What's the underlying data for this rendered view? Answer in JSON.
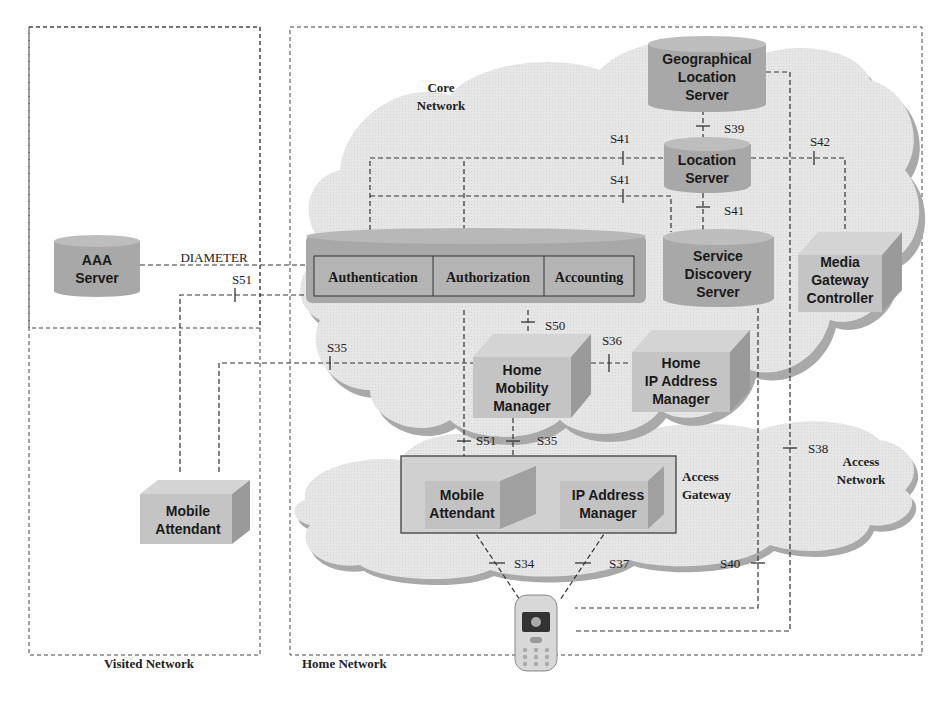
{
  "regions": {
    "visited": {
      "label": "Visited Network"
    },
    "home": {
      "label": "Home Network"
    },
    "core": {
      "label_line1": "Core",
      "label_line2": "Network"
    },
    "access": {
      "label_line1": "Access",
      "label_line2": "Network"
    },
    "access_gateway": {
      "label_line1": "Access",
      "label_line2": "Gateway"
    }
  },
  "nodes": {
    "aaa_server": {
      "line1": "AAA",
      "line2": "Server"
    },
    "geo_location_server": {
      "line1": "Geographical",
      "line2": "Location",
      "line3": "Server"
    },
    "location_server": {
      "line1": "Location",
      "line2": "Server"
    },
    "service_discovery_server": {
      "line1": "Service",
      "line2": "Discovery",
      "line3": "Server"
    },
    "media_gateway_controller": {
      "line1": "Media",
      "line2": "Gateway",
      "line3": "Controller"
    },
    "aaa_block": {
      "authentication": "Authentication",
      "authorization": "Authorization",
      "accounting": "Accounting"
    },
    "home_mobility_manager": {
      "line1": "Home",
      "line2": "Mobility",
      "line3": "Manager"
    },
    "home_ip_address_manager": {
      "line1": "Home",
      "line2": "IP Address",
      "line3": "Manager"
    },
    "visited_mobile_attendant": {
      "line1": "Mobile",
      "line2": "Attendant"
    },
    "gw_mobile_attendant": {
      "line1": "Mobile",
      "line2": "Attendant"
    },
    "gw_ip_address_manager": {
      "line1": "IP Address",
      "line2": "Manager"
    },
    "mobile_terminal": {
      "label": "mobile-phone"
    }
  },
  "interfaces": {
    "diameter": "DIAMETER",
    "s51_top": "S51",
    "s41_a": "S41",
    "s41_b": "S41",
    "s41_c": "S41",
    "s39": "S39",
    "s42": "S42",
    "s50": "S50",
    "s35_left": "S35",
    "s36": "S36",
    "s51_bottom": "S51",
    "s35_bottom": "S35",
    "s38": "S38",
    "s34": "S34",
    "s37": "S37",
    "s40": "S40"
  },
  "colors": {
    "cloud": "#e4e4e4",
    "cloud_shadow": "#a9a9a9",
    "cylinder": "#a8a8a8",
    "cylinder_top": "#bdbdbd",
    "box_front": "#c4c4c4",
    "box_side": "#9a9a9a",
    "box_top": "#d4d4d4"
  }
}
